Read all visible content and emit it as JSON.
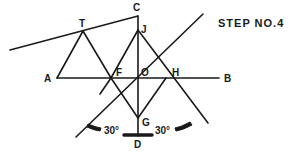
{
  "title": "STEP NO.4",
  "colors": {
    "ink": "#1a1a1a",
    "background": "#ffffff"
  },
  "labels": {
    "C": "C",
    "T": "T",
    "J": "J",
    "A": "A",
    "F": "F",
    "O": "O",
    "H": "H",
    "B": "B",
    "G": "G",
    "D": "D"
  },
  "angles": {
    "left": "30°",
    "right": "30°"
  },
  "points": {
    "C": [
      138,
      17
    ],
    "T": [
      83,
      31
    ],
    "J": [
      138,
      30
    ],
    "A": [
      57,
      77
    ],
    "F": [
      111,
      78
    ],
    "O": [
      138,
      78
    ],
    "H": [
      166,
      78
    ],
    "B": [
      219,
      78
    ],
    "G": [
      138,
      118
    ],
    "D": [
      138,
      135
    ]
  }
}
